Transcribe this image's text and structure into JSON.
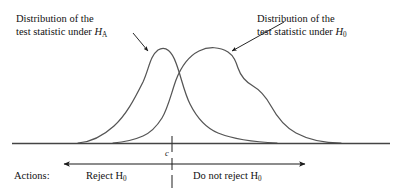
{
  "figure": {
    "background_color": "#ffffff",
    "curve_color": "#555555",
    "axis_color": "#444444",
    "text_color": "#111111"
  },
  "annotations": {
    "left_label_line1": "Distribution of the",
    "left_label_line2_prefix": "test statistic under ",
    "left_label_symbol": "H",
    "left_label_subscript": "A",
    "right_label_line1": "Distribution of the",
    "right_label_line2_prefix": "test statistic under ",
    "right_label_symbol": "H",
    "right_label_subscript": "0",
    "critical_value_label": "c"
  },
  "actions": {
    "row_label": "Actions:",
    "reject_prefix": "Reject ",
    "reject_symbol": "H",
    "reject_subscript": "0",
    "noreject_prefix": "Do not reject ",
    "noreject_symbol": "H",
    "noreject_subscript": "0"
  },
  "chart_data": {
    "type": "line",
    "xlabel": "",
    "ylabel": "",
    "grid": false,
    "legend": "none",
    "axis_baseline_y": 143,
    "critical_value_x": 172,
    "series": [
      {
        "name": "Distribution of the test statistic under HA",
        "peak_x": 155,
        "peak_y": 50,
        "left_tail_x": 78,
        "right_tail_x": 277,
        "path": "M 78,143 C 92,142 103,136 114,126 C 126,115 134,100 143,82 C 149,69 150,56 158,50 C 166,45 172,52 176,63 C 181,76 184,92 190,104 C 197,118 206,128 218,133 C 233,139 252,142 277,143"
      },
      {
        "name": "Distribution of the test statistic under H0",
        "peak_x": 215,
        "peak_y": 49,
        "left_tail_x": 113,
        "right_tail_x": 341,
        "shoulder_x": 243,
        "path": "M 113,143 C 125,142 134,140 143,136 C 152,132 157,126 162,118 C 168,108 171,94 176,80 C 181,67 189,56 199,51 C 209,46 220,47 228,52 C 234,56 236,62 238,68 C 241,77 246,82 253,86 C 260,90 266,97 271,106 C 277,117 285,127 296,133 C 309,140 324,143 341,143"
      }
    ]
  },
  "geometry": {
    "axis_x_start": 12,
    "axis_x_end": 390,
    "arrow_row_y": 164,
    "left_arrow_tip_x": 63,
    "right_arrow_tip_x": 306,
    "pointer_left": "from (133,33) to (149,52)",
    "pointer_right": "from (284,22) to (231,51)"
  }
}
